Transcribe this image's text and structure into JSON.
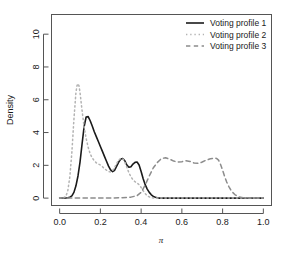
{
  "chart_data": {
    "type": "line",
    "title": "",
    "xlabel": "π",
    "ylabel": "Density",
    "xlim": [
      -0.04,
      1.04
    ],
    "ylim": [
      -0.45,
      11.2
    ],
    "grid": false,
    "legend_position": "top-right",
    "xticks": [
      "0.0",
      "0.2",
      "0.4",
      "0.6",
      "0.8",
      "1.0"
    ],
    "xtick_values": [
      0.0,
      0.2,
      0.4,
      0.6,
      0.8,
      1.0
    ],
    "yticks": [
      "0",
      "2",
      "4",
      "6",
      "8",
      "10"
    ],
    "ytick_values": [
      0,
      2,
      4,
      6,
      8,
      10
    ],
    "series": [
      {
        "name": "Voting profile 1",
        "style": "solid",
        "color": "#1a1a1a",
        "width": 1.6,
        "x": [
          0.0,
          0.02,
          0.04,
          0.05,
          0.06,
          0.07,
          0.08,
          0.09,
          0.1,
          0.11,
          0.12,
          0.13,
          0.14,
          0.15,
          0.16,
          0.17,
          0.18,
          0.19,
          0.2,
          0.21,
          0.22,
          0.23,
          0.24,
          0.25,
          0.26,
          0.27,
          0.28,
          0.29,
          0.3,
          0.31,
          0.32,
          0.33,
          0.34,
          0.35,
          0.36,
          0.37,
          0.38,
          0.39,
          0.4,
          0.41,
          0.42,
          0.43,
          0.44,
          0.45,
          0.46,
          0.47,
          0.48,
          0.49,
          0.52,
          0.58,
          0.66,
          0.74,
          0.82,
          0.9,
          1.0
        ],
        "y": [
          0.0,
          0.0,
          0.02,
          0.06,
          0.14,
          0.35,
          0.75,
          1.35,
          2.2,
          3.3,
          4.35,
          4.95,
          4.97,
          4.72,
          4.4,
          4.05,
          3.75,
          3.45,
          3.15,
          2.85,
          2.55,
          2.25,
          1.95,
          1.72,
          1.62,
          1.7,
          1.95,
          2.2,
          2.38,
          2.42,
          2.28,
          2.02,
          1.88,
          1.92,
          2.08,
          2.18,
          2.2,
          2.02,
          1.62,
          1.18,
          0.82,
          0.55,
          0.35,
          0.2,
          0.1,
          0.05,
          0.02,
          0.0,
          0.0,
          0.0,
          0.0,
          0.0,
          0.0,
          0.0,
          0.0
        ]
      },
      {
        "name": "Voting profile 2",
        "style": "dotted",
        "color": "#b3b3b3",
        "width": 1.5,
        "x": [
          0.0,
          0.02,
          0.03,
          0.04,
          0.05,
          0.06,
          0.07,
          0.08,
          0.085,
          0.09,
          0.095,
          0.1,
          0.11,
          0.12,
          0.13,
          0.14,
          0.15,
          0.16,
          0.17,
          0.18,
          0.19,
          0.2,
          0.21,
          0.22,
          0.23,
          0.24,
          0.25,
          0.26,
          0.27,
          0.28,
          0.29,
          0.3,
          0.31,
          0.32,
          0.33,
          0.34,
          0.35,
          0.36,
          0.37,
          0.38,
          0.39,
          0.4,
          0.41,
          0.42,
          0.43,
          0.44,
          0.45,
          0.46,
          0.5,
          0.6,
          0.75,
          0.9,
          1.0
        ],
        "y": [
          0.0,
          0.02,
          0.1,
          0.45,
          1.3,
          2.8,
          4.8,
          6.45,
          6.85,
          6.98,
          6.85,
          6.45,
          5.35,
          4.35,
          3.65,
          3.1,
          2.7,
          2.45,
          2.28,
          2.15,
          2.08,
          2.02,
          1.92,
          1.8,
          1.7,
          1.62,
          1.6,
          1.68,
          1.88,
          2.12,
          2.32,
          2.42,
          2.4,
          2.2,
          1.88,
          1.55,
          1.3,
          1.12,
          1.0,
          0.92,
          0.82,
          0.65,
          0.45,
          0.28,
          0.15,
          0.07,
          0.03,
          0.0,
          0.0,
          0.0,
          0.0,
          0.0,
          0.0
        ]
      },
      {
        "name": "Voting profile 3",
        "style": "dashed",
        "color": "#8c8c8c",
        "width": 1.5,
        "x": [
          0.0,
          0.1,
          0.2,
          0.3,
          0.35,
          0.38,
          0.4,
          0.42,
          0.44,
          0.46,
          0.48,
          0.5,
          0.52,
          0.54,
          0.56,
          0.58,
          0.6,
          0.62,
          0.64,
          0.66,
          0.68,
          0.7,
          0.72,
          0.74,
          0.76,
          0.77,
          0.78,
          0.79,
          0.8,
          0.81,
          0.82,
          0.83,
          0.84,
          0.85,
          0.86,
          0.87,
          0.88,
          0.9,
          0.93,
          0.96,
          1.0
        ],
        "y": [
          0.0,
          0.0,
          0.0,
          0.02,
          0.06,
          0.15,
          0.35,
          0.8,
          1.35,
          1.85,
          2.18,
          2.42,
          2.46,
          2.38,
          2.26,
          2.2,
          2.22,
          2.28,
          2.24,
          2.14,
          2.12,
          2.2,
          2.32,
          2.4,
          2.44,
          2.42,
          2.32,
          2.05,
          1.7,
          1.32,
          0.98,
          0.72,
          0.5,
          0.34,
          0.22,
          0.14,
          0.08,
          0.03,
          0.01,
          0.0,
          0.0
        ]
      }
    ]
  },
  "legend": {
    "entries": [
      {
        "label": "Voting profile 1"
      },
      {
        "label": "Voting profile 2"
      },
      {
        "label": "Voting profile 3"
      }
    ]
  },
  "axes": {
    "x_title": "π",
    "y_title": "Density"
  }
}
